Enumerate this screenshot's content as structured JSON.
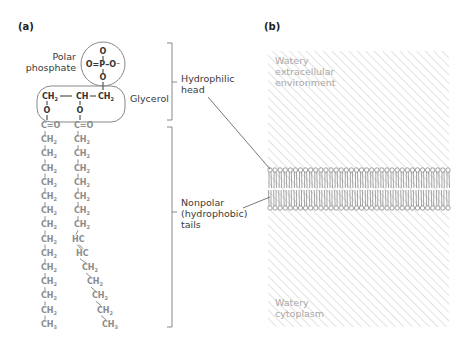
{
  "panel_a": {
    "label": "(a)",
    "phosphate": {
      "label_line1": "Polar",
      "label_line2": "phosphate",
      "top_O": "O",
      "middle": "O=P–O⁻",
      "bottom_O": "O"
    },
    "glycerol": {
      "label": "Glycerol",
      "backbone": [
        "CH₂",
        "—",
        "CH",
        "–",
        "CH₂"
      ],
      "ester_O": "O"
    },
    "tail_left": {
      "carbonyl": "C=O",
      "groups": [
        "CH₂",
        "CH₂",
        "CH₂",
        "CH₂",
        "CH₂",
        "CH₂",
        "CH₂",
        "CH₂",
        "CH₂",
        "CH₂",
        "CH₂",
        "CH₂",
        "CH₂",
        "CH₃"
      ]
    },
    "tail_right": {
      "carbonyl": "C=O",
      "groups": [
        "CH₂",
        "CH₂",
        "CH₂",
        "CH₂",
        "CH₂",
        "CH₂",
        "CH₂",
        "HC",
        "HC",
        "CH₂",
        "CH₂",
        "CH₂",
        "CH₂",
        "CH₃"
      ]
    },
    "bracket_head": {
      "line1": "Hydrophilic",
      "line2": "head"
    },
    "bracket_tails": {
      "line1": "Nonpolar",
      "line2": "(hydrophobic)",
      "line3": "tails"
    }
  },
  "panel_b": {
    "label": "(b)",
    "top_region": {
      "line1": "Watery",
      "line2": "extracellular",
      "line3": "environment"
    },
    "bottom_region": {
      "line1": "Watery",
      "line2": "cytoplasm"
    },
    "lipids_per_leaflet": 36
  },
  "colors": {
    "dark_text": "#333333",
    "grey_chem": "#8c8c8c",
    "hatch": "#d9d9d9",
    "membrane": "#9a9a9a",
    "outline": "#808080"
  }
}
